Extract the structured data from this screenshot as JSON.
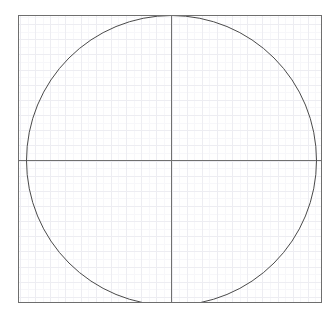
{
  "figure": {
    "name": "circle-in-square-plot",
    "width": 335,
    "height": 312,
    "background_color": "#ffffff"
  },
  "chart_data": {
    "type": "scatter",
    "title": "",
    "subtitle": "",
    "xlabel": "",
    "ylabel": "",
    "xlim": [
      -1.05,
      1.05
    ],
    "ylim": [
      -1.0,
      1.0
    ],
    "xticklabels": [],
    "yticklabels": [],
    "grid": true,
    "grid_minor": true,
    "legend": null,
    "legend_position": "none",
    "annotations": [],
    "series": [
      {
        "name": "unit-circle",
        "shape": "circle",
        "center_x": 0.0,
        "center_y": 0.0,
        "radius": 1.0,
        "stroke_color": "#4a4a4a",
        "stroke_width": 1,
        "fill": "none"
      }
    ],
    "reference_lines": [
      {
        "name": "x-axis-center-line",
        "orientation": "horizontal",
        "value": 0.0,
        "color": "#707070",
        "width": 1
      },
      {
        "name": "y-axis-center-line",
        "orientation": "vertical",
        "value": 0.0,
        "color": "#707070",
        "width": 1
      }
    ]
  },
  "geometry": {
    "frame": {
      "left": 18.5,
      "top": 15.5,
      "right": 321.5,
      "bottom": 302.5,
      "stroke_color": "#6e6e6e",
      "stroke_width": 1
    },
    "center": {
      "x": 171.5,
      "y": 160.5
    },
    "circle_radius": 145,
    "major_grid": {
      "spacing": 15.15,
      "color": "#ededf2",
      "width": 1
    },
    "minor_grid": {
      "spacing": 7.575,
      "color": "#f7f7fa",
      "width": 1
    }
  },
  "colors": {
    "frame": "#6e6e6e",
    "crosshair": "#707070",
    "circle": "#4a4a4a",
    "grid_major": "#ededf2",
    "grid_minor": "#f7f7fa",
    "background": "#ffffff"
  }
}
